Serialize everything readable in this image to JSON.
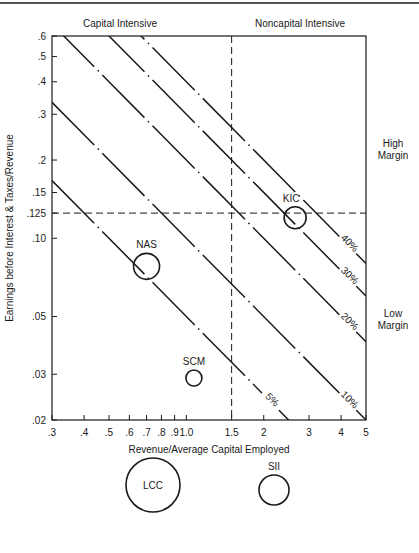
{
  "header": {
    "running_title": ""
  },
  "chart_data": {
    "type": "scatter",
    "title": "",
    "xlabel": "Revenue/Average Capital Employed",
    "ylabel": "Earnings before Interest & Taxes/Revenue",
    "xscale": "log",
    "yscale": "log",
    "xlim": [
      0.3,
      5
    ],
    "ylim": [
      0.02,
      0.6
    ],
    "x_ticks": [
      0.3,
      0.4,
      0.5,
      0.6,
      0.7,
      0.8,
      0.9,
      1.0,
      1.5,
      2,
      3,
      4,
      5
    ],
    "x_tick_labels": [
      ".3",
      ".4",
      ".5",
      ".6",
      ".7",
      ".8",
      ".9",
      "1.0",
      "1.5",
      "2",
      "3",
      "4",
      "5"
    ],
    "y_ticks": [
      0.6,
      0.5,
      0.4,
      0.3,
      0.2,
      0.15,
      0.125,
      0.1,
      0.05,
      0.03,
      0.02
    ],
    "y_tick_labels": [
      ".6",
      ".5",
      ".4",
      ".3",
      ".2",
      ".15",
      ".125",
      ".10",
      ".05",
      ".03",
      ".02"
    ],
    "grid": false,
    "reference_lines": {
      "vertical": {
        "x": 1.5,
        "style": "dashed"
      },
      "horizontal": {
        "y": 0.125,
        "style": "dashed"
      }
    },
    "quadrant_labels": {
      "top_left": "Capital Intensive",
      "top_right": "Noncapital Intensive",
      "right_upper": [
        "High",
        "Margin"
      ],
      "right_lower": [
        "Low",
        "Margin"
      ]
    },
    "iso_return_lines": [
      {
        "roce": 0.05,
        "label": "5%"
      },
      {
        "roce": 0.1,
        "label": "10%"
      },
      {
        "roce": 0.2,
        "label": "20%"
      },
      {
        "roce": 0.3,
        "label": "30%"
      },
      {
        "roce": 0.4,
        "label": "40%"
      }
    ],
    "points": [
      {
        "name": "NAS",
        "x": 0.7,
        "y": 0.078,
        "r": 13
      },
      {
        "name": "SCM",
        "x": 1.07,
        "y": 0.029,
        "r": 8
      },
      {
        "name": "KIC",
        "x": 2.65,
        "y": 0.12,
        "r": 11
      }
    ],
    "off_chart_bubbles": [
      {
        "name": "LCC",
        "cx": 153,
        "cy": 485,
        "r": 27
      },
      {
        "name": "SII",
        "cx": 274,
        "cy": 490,
        "r": 15
      }
    ]
  }
}
